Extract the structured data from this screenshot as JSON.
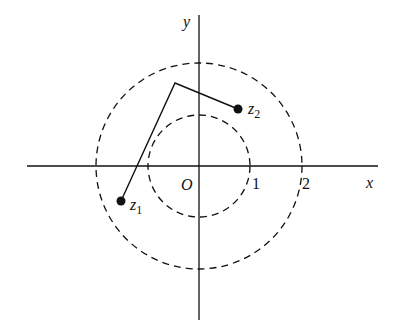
{
  "diagram": {
    "type": "complex-plane",
    "axes": {
      "x_label": "x",
      "y_label": "y",
      "origin_label": "O"
    },
    "circles": [
      {
        "name": "inner",
        "radius": 1,
        "style": "dashed",
        "label": "1"
      },
      {
        "name": "outer",
        "radius": 2,
        "style": "dashed",
        "label": "2"
      }
    ],
    "points": [
      {
        "name": "z1",
        "label": "z",
        "subscript": "1"
      },
      {
        "name": "z2",
        "label": "z",
        "subscript": "2"
      }
    ],
    "polyline": {
      "description": "broken path from z1 to a vertex then to z2",
      "style": "solid"
    },
    "colors": {
      "ink": "#111111",
      "background": "#ffffff"
    }
  }
}
